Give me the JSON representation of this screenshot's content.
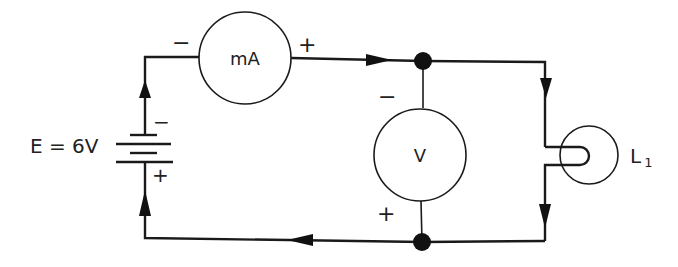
{
  "diagram": {
    "type": "series circuit with ammeter and voltmeter",
    "source": {
      "label": "E = 6V",
      "minus": "−",
      "plus": "+"
    },
    "ammeter": {
      "label": "mA",
      "minus": "−",
      "plus": "+"
    },
    "voltmeter": {
      "label": "V",
      "minus": "−",
      "plus": "+"
    },
    "lamp": {
      "label": "L",
      "subscript": "1"
    },
    "current_direction": "clockwise (from battery + up through left side, across top, down right through lamp, back along bottom)",
    "colors": {
      "line": "#1a1a1a",
      "background": "#ffffff"
    }
  }
}
